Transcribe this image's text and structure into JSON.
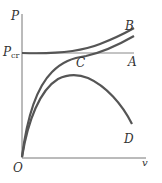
{
  "diagram": {
    "axes": {
      "y_label": "P",
      "x_label": "v",
      "origin_label": "O",
      "critical_label_main": "P",
      "critical_label_sub": "cr"
    },
    "curves": [
      {
        "id": "A",
        "label": "A",
        "description": "horizontal line at P_cr"
      },
      {
        "id": "B",
        "label": "B",
        "description": "rising curve starting at P_cr"
      },
      {
        "id": "C",
        "label": "C",
        "description": "curve from origin approaching and crossing toward B"
      },
      {
        "id": "D",
        "label": "D",
        "description": "curve from origin reaching a peak below P_cr then decreasing"
      }
    ],
    "colors": {
      "axis": "#777777",
      "curve": "#555555",
      "text": "#333333"
    }
  }
}
